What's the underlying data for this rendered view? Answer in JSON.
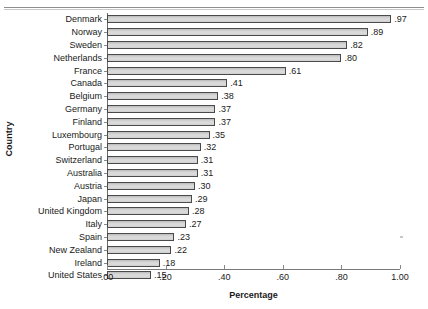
{
  "chart_data": {
    "type": "bar",
    "orientation": "horizontal",
    "title": "",
    "xlabel": "Percentage",
    "ylabel": "Country",
    "xlim": [
      0.0,
      1.0
    ],
    "grid": false,
    "legend": null,
    "xtick_labels": [
      ".00",
      ".20",
      ".40",
      ".60",
      ".80",
      "1.00"
    ],
    "xtick_values": [
      0.0,
      0.2,
      0.4,
      0.6,
      0.8,
      1.0
    ],
    "categories": [
      "Denmark",
      "Norway",
      "Sweden",
      "Netherlands",
      "France",
      "Canada",
      "Belgium",
      "Germany",
      "Finland",
      "Luxembourg",
      "Portugal",
      "Switzerland",
      "Australia",
      "Austria",
      "Japan",
      "United Kingdom",
      "Italy",
      "Spain",
      "New Zealand",
      "Ireland",
      "United States"
    ],
    "values": [
      0.97,
      0.89,
      0.82,
      0.8,
      0.61,
      0.41,
      0.38,
      0.37,
      0.37,
      0.35,
      0.32,
      0.31,
      0.31,
      0.3,
      0.29,
      0.28,
      0.27,
      0.23,
      0.22,
      0.18,
      0.15
    ],
    "value_labels": [
      ".97",
      ".89",
      ".82",
      ".80",
      ".61",
      ".41",
      ".38",
      ".37",
      ".37",
      ".35",
      ".32",
      ".31",
      ".31",
      ".30",
      ".29",
      ".28",
      ".27",
      ".23",
      ".22",
      ".18",
      ".15"
    ],
    "bar_fill_color": "#d6d6d6",
    "bar_edge_color": "#4a4a4a",
    "background_color": "#ffffff"
  }
}
